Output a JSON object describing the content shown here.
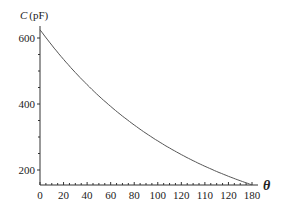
{
  "chart_data": {
    "type": "line",
    "title": "",
    "xlabel": "θ",
    "ylabel": "C (pF)",
    "xlim": [
      0,
      180
    ],
    "ylim": [
      145,
      640
    ],
    "grid": false,
    "legend": null,
    "x_tick_labels": [
      "0",
      "20",
      "40",
      "60",
      "80",
      "100",
      "120",
      "110",
      "120",
      "180"
    ],
    "x_tick_values": [
      0,
      20,
      40,
      60,
      80,
      100,
      120,
      140,
      160,
      180
    ],
    "y_tick_labels": [
      "600",
      "400",
      "200"
    ],
    "y_tick_values": [
      600,
      400,
      200
    ],
    "series": [
      {
        "name": "C(θ)",
        "color": "#555555",
        "x": [
          0,
          20,
          40,
          60,
          80,
          100,
          120,
          140,
          160,
          180
        ],
        "values": [
          625,
          535,
          459,
          393,
          337,
          288,
          247,
          211,
          181,
          155
        ]
      }
    ]
  },
  "labels": {
    "y_axis_C": "C",
    "y_axis_unit": "(pF)",
    "x_axis_theta": "θ"
  }
}
